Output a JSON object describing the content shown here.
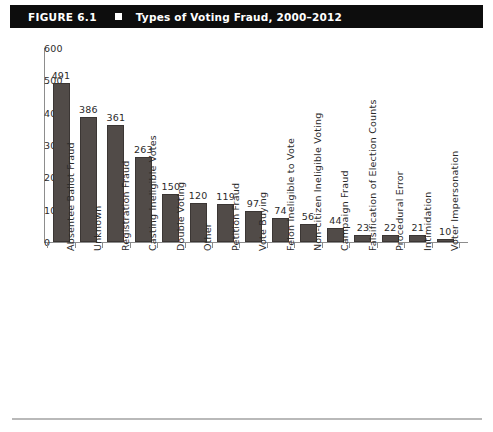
{
  "header": {
    "figure_number": "FIGURE 6.1",
    "separator_icon": "black-square-bullet",
    "title": "Types of Voting Fraud, 2000–2012"
  },
  "chart_data": {
    "type": "bar",
    "title": "Types of Voting Fraud, 2000–2012",
    "xlabel": "",
    "ylabel": "",
    "ylim": [
      0,
      600
    ],
    "yticks": [
      0,
      100,
      200,
      300,
      400,
      500,
      600
    ],
    "ytick_labels": [
      "0",
      "100",
      "200",
      "300",
      "400",
      "500",
      "600"
    ],
    "grid": false,
    "legend": false,
    "bar_color": "#514b48",
    "axis_color": "#8d8d8d",
    "text_color": "#2b2b2b",
    "categories": [
      "Absentee Ballot Fraud",
      "Unknown",
      "Registration Fraud",
      "Casting Ineligible Votes",
      "Double Voting",
      "Other",
      "Petition Fraud",
      "Vote Buying",
      "Felon Ineligible to Vote",
      "Non-citizen Ineligible Voting",
      "Campaign Fraud",
      "Falsification of Election Counts",
      "Procedural Error",
      "Intimidation",
      "Voter Impersonation"
    ],
    "values": [
      491,
      386,
      361,
      263,
      150,
      120,
      119,
      97,
      74,
      56,
      44,
      23,
      22,
      21,
      10
    ],
    "value_labels": [
      "491",
      "386",
      "361",
      "263",
      "150",
      "120",
      "119",
      "97",
      "74",
      "56",
      "44",
      "23",
      "22",
      "21",
      "10"
    ]
  }
}
